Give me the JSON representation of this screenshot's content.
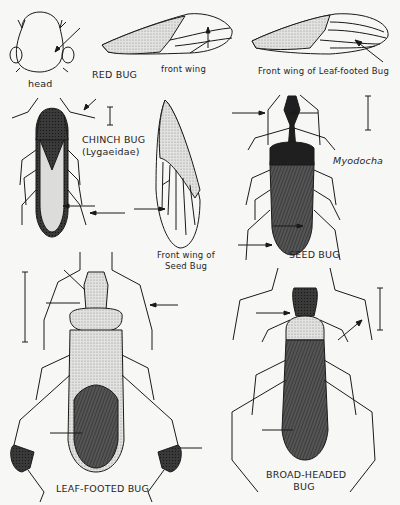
{
  "plate": {
    "labels": {
      "head": "head",
      "red_bug": "RED BUG",
      "front_wing": "front wing",
      "front_wing_leaf_footed": "Front wing of Leaf-footed Bug",
      "chinch_bug": "CHINCH BUG",
      "chinch_bug_family": "(Lygaeidae)",
      "front_wing_seed_bug_line1": "Front wing of",
      "front_wing_seed_bug_line2": "Seed Bug",
      "myodocha": "Myodocha",
      "seed_bug": "SEED BUG",
      "leaf_footed_bug": "LEAF-FOOTED BUG",
      "broad_headed_bug_line1": "BROAD-HEADED",
      "broad_headed_bug_line2": "BUG"
    },
    "figures": [
      {
        "name": "red-bug-head",
        "type": "outline-drawing"
      },
      {
        "name": "red-bug-front-wing",
        "type": "outline-drawing"
      },
      {
        "name": "leaf-footed-bug-front-wing",
        "type": "outline-drawing"
      },
      {
        "name": "chinch-bug",
        "type": "stippled-illustration"
      },
      {
        "name": "seed-bug-front-wing",
        "type": "outline-drawing"
      },
      {
        "name": "seed-bug-myodocha",
        "type": "stippled-illustration"
      },
      {
        "name": "leaf-footed-bug",
        "type": "stippled-illustration"
      },
      {
        "name": "broad-headed-bug",
        "type": "stippled-illustration"
      }
    ],
    "colors": {
      "paper": "#f7f7f5",
      "ink": "#1a1a1a",
      "dark_body": "#2b2b2b",
      "mid_body": "#6a6a6a",
      "stipple": "#bdbdbd"
    }
  }
}
